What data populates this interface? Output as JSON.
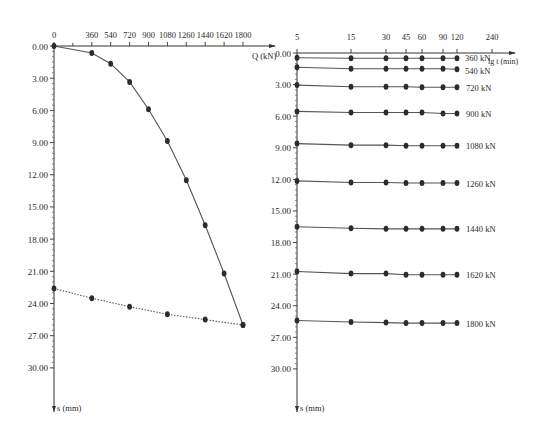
{
  "chart_data": [
    {
      "type": "line",
      "title": "",
      "xlabel": "Q (kN)",
      "ylabel": "s (mm)",
      "x_ticks": [
        0,
        360,
        540,
        720,
        900,
        1080,
        1260,
        1440,
        1620,
        1800
      ],
      "y_ticks": [
        "0.00",
        "3.00",
        "6.00",
        "9.00",
        "12.00",
        "15.00",
        "18.00",
        "21.00",
        "24.00",
        "27.00",
        "30.00"
      ],
      "xlim": [
        0,
        1800
      ],
      "ylim": [
        0,
        30
      ],
      "y_inverted": true,
      "x_axis_position": "top",
      "grid": false,
      "series": [
        {
          "name": "Q-s curve",
          "style": "solid",
          "x": [
            0,
            360,
            540,
            720,
            900,
            1080,
            1260,
            1440,
            1620,
            1800
          ],
          "values": [
            0.0,
            0.65,
            1.65,
            3.35,
            5.9,
            8.85,
            12.5,
            16.7,
            21.2,
            26.0
          ]
        },
        {
          "name": "residual/secondary curve",
          "style": "dotted",
          "x": [
            0,
            360,
            720,
            1080,
            1440,
            1800
          ],
          "values": [
            22.6,
            23.5,
            24.3,
            25.0,
            25.5,
            26.0
          ]
        }
      ]
    },
    {
      "type": "line",
      "title": "",
      "xlabel": "lg t (min)",
      "ylabel": "s (mm)",
      "x_ticks": [
        5,
        15,
        30,
        45,
        60,
        90,
        120,
        240
      ],
      "y_ticks": [
        "0.00",
        "3.00",
        "6.00",
        "9.00",
        "12.00",
        "15.00",
        "18.00",
        "21.00",
        "24.00",
        "27.00",
        "30.00"
      ],
      "ylim": [
        0,
        30
      ],
      "y_inverted": true,
      "x_axis_position": "top",
      "x_scale": "log",
      "grid": false,
      "series": [
        {
          "name": "360 kN",
          "x": [
            5,
            15,
            30,
            45,
            60,
            90,
            120
          ],
          "values": [
            0.45,
            0.5,
            0.5,
            0.5,
            0.5,
            0.5,
            0.5
          ]
        },
        {
          "name": "540 kN",
          "x": [
            5,
            15,
            30,
            45,
            60,
            90,
            120
          ],
          "values": [
            1.35,
            1.5,
            1.5,
            1.5,
            1.5,
            1.5,
            1.55
          ]
        },
        {
          "name": "720 kN",
          "x": [
            5,
            15,
            30,
            45,
            60,
            90,
            120
          ],
          "values": [
            3.05,
            3.2,
            3.2,
            3.2,
            3.25,
            3.25,
            3.25
          ]
        },
        {
          "name": "900 kN",
          "x": [
            5,
            15,
            30,
            45,
            60,
            90,
            120
          ],
          "values": [
            5.55,
            5.65,
            5.65,
            5.65,
            5.65,
            5.75,
            5.75
          ]
        },
        {
          "name": "1080 kN",
          "x": [
            5,
            15,
            30,
            45,
            60,
            90,
            120
          ],
          "values": [
            8.6,
            8.75,
            8.75,
            8.8,
            8.8,
            8.8,
            8.8
          ]
        },
        {
          "name": "1260 kN",
          "x": [
            5,
            15,
            30,
            45,
            60,
            90,
            120
          ],
          "values": [
            12.15,
            12.3,
            12.3,
            12.35,
            12.35,
            12.35,
            12.35
          ]
        },
        {
          "name": "1440 kN",
          "x": [
            5,
            15,
            30,
            45,
            60,
            90,
            120
          ],
          "values": [
            16.5,
            16.65,
            16.7,
            16.7,
            16.7,
            16.7,
            16.7
          ]
        },
        {
          "name": "1620 kN",
          "x": [
            5,
            15,
            30,
            45,
            60,
            90,
            120
          ],
          "values": [
            20.75,
            20.95,
            20.95,
            21.05,
            21.05,
            21.05,
            21.05
          ]
        },
        {
          "name": "1800 kN",
          "x": [
            5,
            15,
            30,
            45,
            60,
            90,
            120
          ],
          "values": [
            25.4,
            25.55,
            25.6,
            25.65,
            25.65,
            25.65,
            25.65
          ]
        }
      ]
    }
  ],
  "left_panel": {
    "x_axis_label": "Q (kN)",
    "y_axis_label": "s (mm)"
  },
  "right_panel": {
    "x_axis_label": "lg t (min)",
    "y_axis_label": "s (mm)"
  }
}
